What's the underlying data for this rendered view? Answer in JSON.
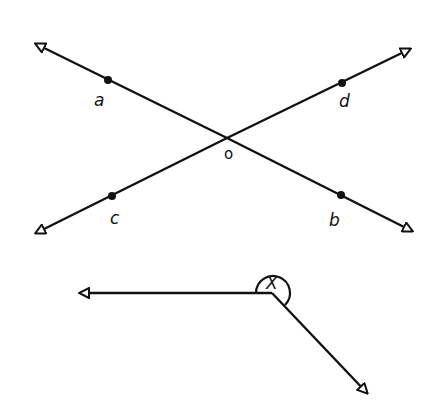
{
  "figure_1": {
    "description": "Two intersecting lines at point o",
    "points": {
      "a": {
        "label": "a"
      },
      "b": {
        "label": "b"
      },
      "c": {
        "label": "c"
      },
      "d": {
        "label": "d"
      },
      "o": {
        "label": "o"
      }
    }
  },
  "figure_2": {
    "description": "Reflex angle marked x",
    "angle_label": "X"
  },
  "colors": {
    "stroke": "#111111",
    "background": "#ffffff"
  }
}
